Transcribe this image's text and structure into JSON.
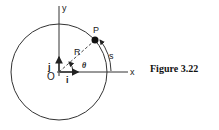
{
  "figure": {
    "caption": "Figure 3.22",
    "labels": {
      "y_axis": "y",
      "x_axis": "x",
      "origin": "O",
      "point": "P",
      "radius": "R",
      "angle": "θ",
      "arc_length": "s",
      "unit_i": "i",
      "unit_j": "j"
    },
    "colors": {
      "stroke": "#222222",
      "background": "#ffffff"
    }
  }
}
